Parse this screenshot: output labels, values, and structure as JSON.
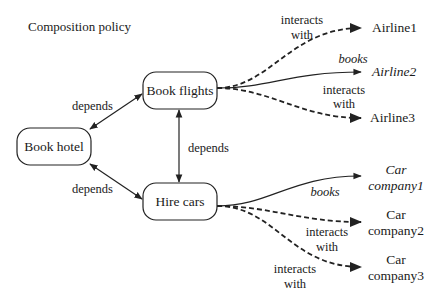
{
  "title": "Composition policy",
  "nodes": {
    "book_hotel": "Book hotel",
    "book_flights": "Book flights",
    "hire_cars": "Hire cars"
  },
  "edges": {
    "hotel_flights": "depends",
    "hotel_cars": "depends",
    "flights_cars": "depends"
  },
  "airlines": [
    {
      "name": "Airline1",
      "relation": [
        "interacts",
        "with"
      ],
      "italic": false,
      "style": "dashed"
    },
    {
      "name": "Airline2",
      "relation": [
        "books"
      ],
      "italic": true,
      "style": "solid"
    },
    {
      "name": "Airline3",
      "relation": [
        "interacts",
        "with"
      ],
      "italic": false,
      "style": "dashed"
    }
  ],
  "car_companies": [
    {
      "name": [
        "Car",
        "company1"
      ],
      "relation": [
        "books"
      ],
      "italic": true,
      "style": "solid"
    },
    {
      "name": [
        "Car",
        "company2"
      ],
      "relation": [
        "interacts",
        "with"
      ],
      "italic": false,
      "style": "dashed"
    },
    {
      "name": [
        "Car",
        "company3"
      ],
      "relation": [
        "interacts",
        "with"
      ],
      "italic": false,
      "style": "dashed"
    }
  ]
}
